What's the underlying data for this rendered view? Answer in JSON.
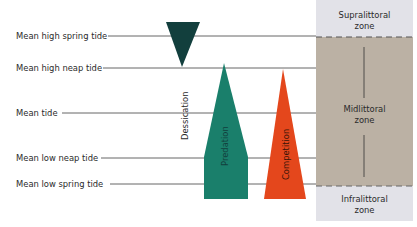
{
  "tide_levels": [
    {
      "label": "Mean high spring tide",
      "y": 36,
      "line_start": 108
    },
    {
      "label": "Mean high neap tide",
      "y": 68,
      "line_start": 103
    },
    {
      "label": "Mean tide",
      "y": 113,
      "line_start": 62
    },
    {
      "label": "Mean low neap tide",
      "y": 158,
      "line_start": 101
    },
    {
      "label": "Mean low spring tide",
      "y": 184,
      "line_start": 110
    }
  ],
  "factors": [
    {
      "name": "Dessication",
      "color": "#123f3d",
      "shape": "inverted-triangle"
    },
    {
      "name": "Predation",
      "color": "#1a7f6b",
      "shape": "tapered-column"
    },
    {
      "name": "Competition",
      "color": "#e4471c",
      "shape": "triangle"
    }
  ],
  "zones": [
    {
      "line1": "Supralittoral",
      "line2": "zone",
      "color": "#e2e2e8"
    },
    {
      "line1": "Midlittoral",
      "line2": "zone",
      "color": "#bbb1a4"
    },
    {
      "line1": "Infralittoral",
      "line2": "zone",
      "color": "#e2e2e8"
    }
  ],
  "colors": {
    "line": "#555555",
    "text": "#2a2a2a"
  }
}
